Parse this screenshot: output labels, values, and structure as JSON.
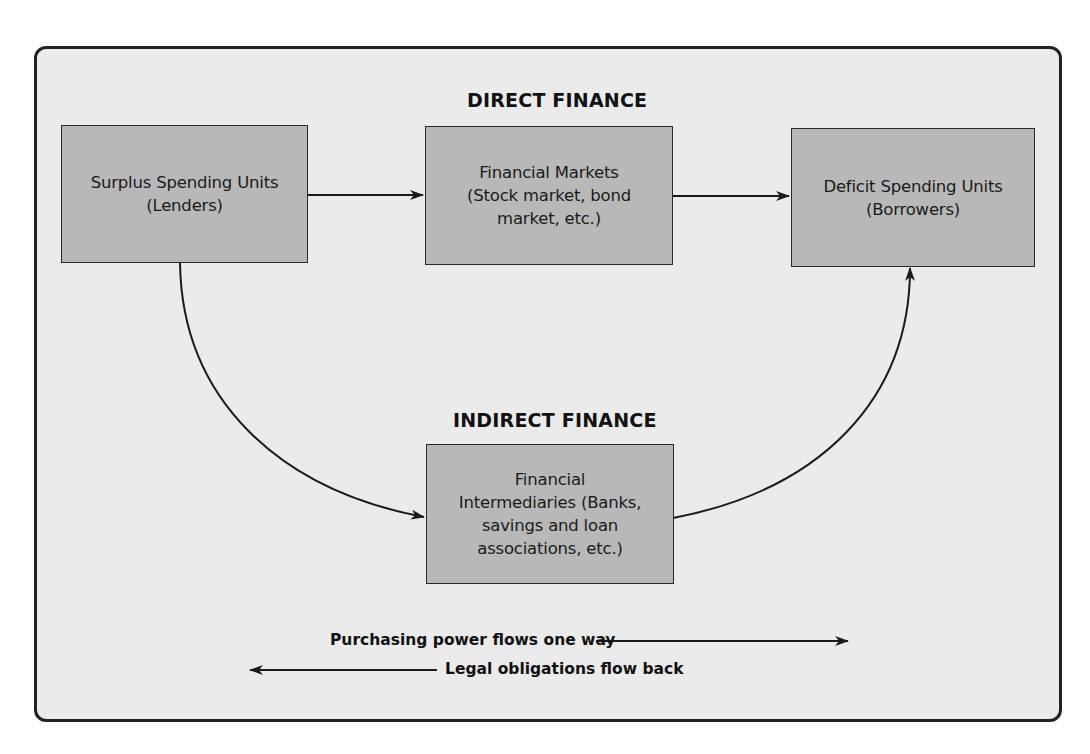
{
  "diagram": {
    "headings": {
      "direct": "DIRECT FINANCE",
      "indirect": "INDIRECT FINANCE"
    },
    "nodes": [
      {
        "id": "surplus",
        "label": "Surplus Spending Units\n(Lenders)"
      },
      {
        "id": "markets",
        "label": "Financial Markets\n(Stock market, bond\nmarket, etc.)"
      },
      {
        "id": "deficit",
        "label": "Deficit Spending Units\n(Borrowers)"
      },
      {
        "id": "intermediaries",
        "label": "Financial\nIntermediaries (Banks,\nsavings and loan\nassociations, etc.)"
      }
    ],
    "edges": [
      {
        "from": "surplus",
        "to": "markets",
        "style": "straight"
      },
      {
        "from": "markets",
        "to": "deficit",
        "style": "straight"
      },
      {
        "from": "surplus",
        "to": "intermediaries",
        "style": "curved"
      },
      {
        "from": "intermediaries",
        "to": "deficit",
        "style": "curved"
      }
    ],
    "legend": {
      "forward": "Purchasing power flows one way",
      "backward": "Legal obligations flow back"
    },
    "colors": {
      "background": "#ebebeb",
      "node_fill": "#b8b8b8",
      "stroke": "#1a1a1a"
    }
  }
}
